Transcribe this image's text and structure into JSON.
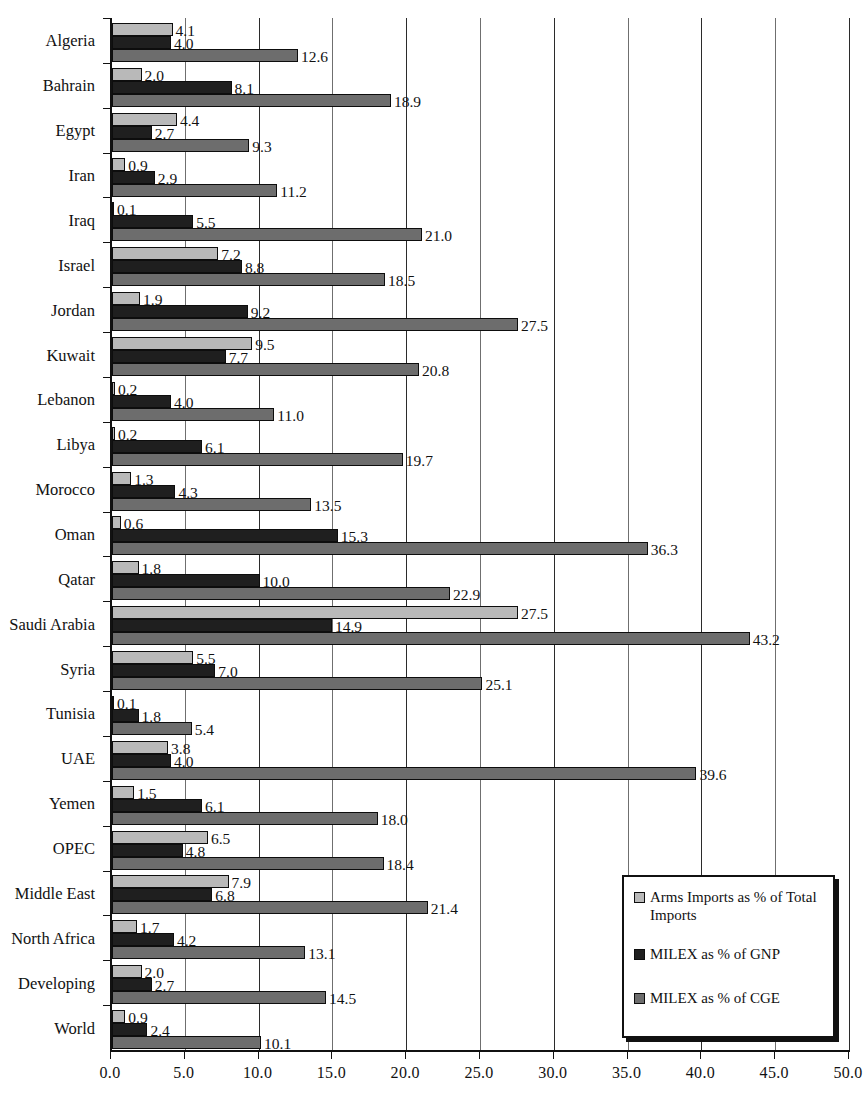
{
  "chart_data": {
    "type": "bar",
    "orientation": "horizontal",
    "title": "",
    "xlabel": "",
    "ylabel": "",
    "xlim": [
      0,
      50
    ],
    "xticks": [
      "0.0",
      "5.0",
      "10.0",
      "15.0",
      "20.0",
      "25.0",
      "30.0",
      "35.0",
      "40.0",
      "45.0",
      "50.0"
    ],
    "grid": true,
    "legend_position": "bottom-right",
    "categories": [
      "Algeria",
      "Bahrain",
      "Egypt",
      "Iran",
      "Iraq",
      "Israel",
      "Jordan",
      "Kuwait",
      "Lebanon",
      "Libya",
      "Morocco",
      "Oman",
      "Qatar",
      "Saudi Arabia",
      "Syria",
      "Tunisia",
      "UAE",
      "Yemen",
      "OPEC",
      "Middle East",
      "North Africa",
      "Developing",
      "World"
    ],
    "series": [
      {
        "name": "Arms Imports as % of Total Imports",
        "color": "#b9b9b9",
        "values": [
          4.1,
          2.0,
          4.4,
          0.9,
          0.1,
          7.2,
          1.9,
          9.5,
          0.2,
          0.2,
          1.3,
          0.6,
          1.8,
          27.5,
          5.5,
          0.1,
          3.8,
          1.5,
          6.5,
          7.9,
          1.7,
          2.0,
          0.9
        ]
      },
      {
        "name": "MILEX as % of GNP",
        "color": "#1f1f1f",
        "values": [
          4.0,
          8.1,
          2.7,
          2.9,
          5.5,
          8.8,
          9.2,
          7.7,
          4.0,
          6.1,
          4.3,
          15.3,
          10.0,
          14.9,
          7.0,
          1.8,
          4.0,
          6.1,
          4.8,
          6.8,
          4.2,
          2.7,
          2.4
        ]
      },
      {
        "name": "MILEX as % of CGE",
        "color": "#6d6d6d",
        "values": [
          12.6,
          18.9,
          9.3,
          11.2,
          21.0,
          18.5,
          27.5,
          20.8,
          11.0,
          19.7,
          13.5,
          36.3,
          22.9,
          43.2,
          25.1,
          5.4,
          39.6,
          18.0,
          18.4,
          21.4,
          13.1,
          14.5,
          10.1
        ]
      }
    ]
  },
  "legend": {
    "items": [
      "Arms Imports as % of Total Imports",
      "MILEX as % of GNP",
      "MILEX as % of CGE"
    ]
  },
  "caption": ""
}
